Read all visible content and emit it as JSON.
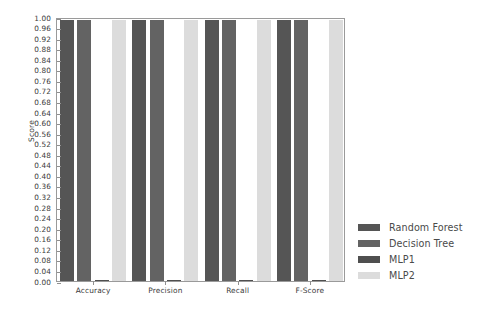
{
  "chart_data": {
    "type": "bar",
    "title": "",
    "xlabel": "",
    "ylabel": "Score",
    "categories": [
      "Accuracy",
      "Precision",
      "Recall",
      "F-Score"
    ],
    "series": [
      {
        "name": "Random Forest",
        "color": "#555555",
        "values": [
          0.99,
          0.99,
          0.99,
          0.99
        ]
      },
      {
        "name": "Decision Tree",
        "color": "#636363",
        "values": [
          0.99,
          0.99,
          0.99,
          0.99
        ]
      },
      {
        "name": "MLP1",
        "color": "#4f4f4f",
        "values": [
          0.005,
          0.005,
          0.005,
          0.005
        ]
      },
      {
        "name": "MLP2",
        "color": "#dcdcdc",
        "values": [
          0.99,
          0.99,
          0.99,
          0.99
        ]
      }
    ],
    "ylim": [
      0.0,
      1.0
    ],
    "ytick_step": 0.04,
    "yticks": [
      "1.00",
      "0.96",
      "0.92",
      "0.88",
      "0.84",
      "0.80",
      "0.76",
      "0.72",
      "0.68",
      "0.64",
      "0.60",
      "0.56",
      "0.52",
      "0.48",
      "0.44",
      "0.40",
      "0.36",
      "0.32",
      "0.28",
      "0.24",
      "0.20",
      "0.16",
      "0.12",
      "0.08",
      "0.04",
      "0.00"
    ],
    "grid": false,
    "legend_position": "right-outside",
    "legend_frame": false
  },
  "legend": {
    "entries": [
      {
        "label": "Random Forest",
        "color": "#555555"
      },
      {
        "label": "Decision Tree",
        "color": "#636363"
      },
      {
        "label": "MLP1",
        "color": "#4f4f4f"
      },
      {
        "label": "MLP2",
        "color": "#dcdcdc"
      }
    ]
  }
}
